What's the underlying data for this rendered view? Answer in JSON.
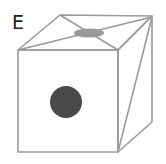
{
  "figure": {
    "label": "E",
    "colors": {
      "edges": "#9a9a9a",
      "front_dot": "#4a4a4a",
      "top_dot": "#999999",
      "label": "#222222",
      "background": "#ffffff"
    }
  }
}
